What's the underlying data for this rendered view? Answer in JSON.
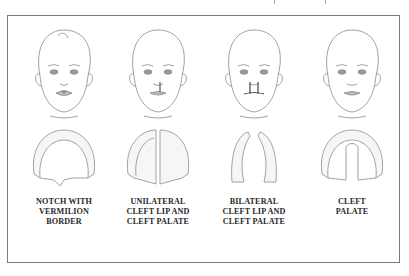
{
  "figure": {
    "panels": [
      {
        "id": "notch",
        "face_condition": "notch-lip",
        "palate_condition": "notch",
        "label_lines": [
          "NOTCH WITH",
          "VERMILION",
          "BORDER"
        ]
      },
      {
        "id": "unilateral",
        "face_condition": "unilateral-cleft",
        "palate_condition": "unilateral",
        "label_lines": [
          "UNILATERAL",
          "CLEFT LIP AND",
          "CLEFT PALATE"
        ]
      },
      {
        "id": "bilateral",
        "face_condition": "bilateral-cleft",
        "palate_condition": "bilateral",
        "label_lines": [
          "BILATERAL",
          "CLEFT LIP AND",
          "CLEFT PALATE"
        ]
      },
      {
        "id": "cleft-palate",
        "face_condition": "normal-lip",
        "palate_condition": "cleft-palate",
        "label_lines": [
          "CLEFT",
          "PALATE"
        ]
      }
    ],
    "colors": {
      "frame_border": "#7a7a7a",
      "sketch_line": "#8a8a8a",
      "label_text": "#2a2a2a",
      "background": "#ffffff"
    }
  }
}
